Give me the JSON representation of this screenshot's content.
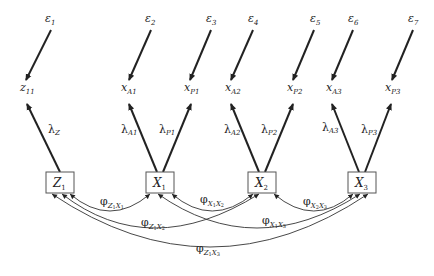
{
  "diagram": {
    "type": "structural-equation-model-path-diagram",
    "errors": [
      {
        "id": "e1",
        "label": "ε",
        "sub": "1",
        "x": 50,
        "y": 22
      },
      {
        "id": "e2",
        "label": "ε",
        "sub": "2",
        "x": 150,
        "y": 22
      },
      {
        "id": "e3",
        "label": "ε",
        "sub": "3",
        "x": 211,
        "y": 22
      },
      {
        "id": "e4",
        "label": "ε",
        "sub": "4",
        "x": 253,
        "y": 22
      },
      {
        "id": "e5",
        "label": "ε",
        "sub": "5",
        "x": 315,
        "y": 22
      },
      {
        "id": "e6",
        "label": "ε",
        "sub": "6",
        "x": 353,
        "y": 22
      },
      {
        "id": "e7",
        "label": "ε",
        "sub": "7",
        "x": 413,
        "y": 22
      }
    ],
    "indicators": [
      {
        "id": "z11",
        "label": "z",
        "sub": "11",
        "x": 27,
        "y": 90
      },
      {
        "id": "xA1",
        "label": "x",
        "sub": "A1",
        "x": 130,
        "y": 90
      },
      {
        "id": "xP1",
        "label": "x",
        "sub": "P1",
        "x": 192,
        "y": 90
      },
      {
        "id": "xA2",
        "label": "x",
        "sub": "A2",
        "x": 233,
        "y": 90
      },
      {
        "id": "xP2",
        "label": "x",
        "sub": "P2",
        "x": 295,
        "y": 90
      },
      {
        "id": "xA3",
        "label": "x",
        "sub": "A3",
        "x": 333,
        "y": 90
      },
      {
        "id": "xP3",
        "label": "x",
        "sub": "P3",
        "x": 392,
        "y": 90
      }
    ],
    "latents": [
      {
        "id": "Z1",
        "label": "Z",
        "sub": "1",
        "x": 60,
        "y": 183
      },
      {
        "id": "X1",
        "label": "X",
        "sub": "1",
        "x": 160,
        "y": 183
      },
      {
        "id": "X2",
        "label": "X",
        "sub": "2",
        "x": 262,
        "y": 183
      },
      {
        "id": "X3",
        "label": "X",
        "sub": "3",
        "x": 362,
        "y": 183
      }
    ],
    "loadings": [
      {
        "label": "λ",
        "sub": "Z",
        "from": "Z1",
        "to": "z11"
      },
      {
        "label": "λ",
        "sub": "A1",
        "from": "X1",
        "to": "xA1"
      },
      {
        "label": "λ",
        "sub": "P1",
        "from": "X1",
        "to": "xP1"
      },
      {
        "label": "λ",
        "sub": "A2",
        "from": "X2",
        "to": "xA2"
      },
      {
        "label": "λ",
        "sub": "P2",
        "from": "X2",
        "to": "xP2"
      },
      {
        "label": "λ",
        "sub": "A3",
        "from": "X3",
        "to": "xA3"
      },
      {
        "label": "λ",
        "sub": "P3",
        "from": "X3",
        "to": "xP3"
      }
    ],
    "covariances": [
      {
        "label": "φ",
        "sub": "Z1X1",
        "sub_display": [
          "Z",
          "1",
          "X",
          "1"
        ],
        "from": "Z1",
        "to": "X1"
      },
      {
        "label": "φ",
        "sub": "X1X2",
        "sub_display": [
          "X",
          "1",
          "X",
          "2"
        ],
        "from": "X1",
        "to": "X2"
      },
      {
        "label": "φ",
        "sub": "X2X3",
        "sub_display": [
          "X",
          "2",
          "X",
          "3"
        ],
        "from": "X2",
        "to": "X3"
      },
      {
        "label": "φ",
        "sub": "Z1X2",
        "sub_display": [
          "Z",
          "1",
          "X",
          "2"
        ],
        "from": "Z1",
        "to": "X2"
      },
      {
        "label": "φ",
        "sub": "X1X3",
        "sub_display": [
          "X",
          "1",
          "X",
          "3"
        ],
        "from": "X1",
        "to": "X3"
      },
      {
        "label": "φ",
        "sub": "Z1X3",
        "sub_display": [
          "Z",
          "1",
          "X",
          "3"
        ],
        "from": "Z1",
        "to": "X3"
      }
    ],
    "colors": {
      "line": "#222222",
      "box_border": "#555555",
      "background": "#ffffff"
    }
  }
}
